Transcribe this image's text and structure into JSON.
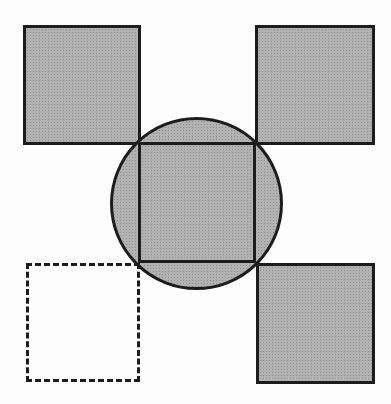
{
  "colors": {
    "page-bg": "#fdfdfd",
    "shape-fill": "#b2b2b2",
    "shape-dot": "#8f8f8f",
    "shape-stroke": "#1c1c1c"
  },
  "figure": {
    "kind": "geometric-diagram",
    "shapes": [
      {
        "id": "square-top-left",
        "kind": "square",
        "style": "filled",
        "x": 23,
        "y": 25,
        "w": 118,
        "h": 120
      },
      {
        "id": "square-top-right",
        "kind": "square",
        "style": "filled",
        "x": 255,
        "y": 25,
        "w": 120,
        "h": 120
      },
      {
        "id": "circle-center",
        "kind": "circle",
        "style": "filled",
        "x": 110,
        "y": 117,
        "w": 173,
        "h": 173
      },
      {
        "id": "square-center",
        "kind": "square",
        "style": "filled",
        "x": 138,
        "y": 142,
        "w": 118,
        "h": 121
      },
      {
        "id": "square-bottom-left",
        "kind": "square",
        "style": "dashed",
        "x": 26,
        "y": 263,
        "w": 114,
        "h": 119
      },
      {
        "id": "square-bottom-right",
        "kind": "square",
        "style": "filled",
        "x": 256,
        "y": 263,
        "w": 119,
        "h": 121
      }
    ]
  }
}
